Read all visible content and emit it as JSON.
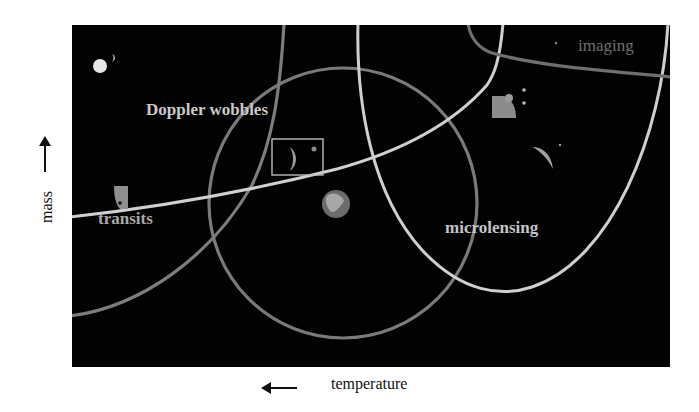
{
  "diagram": {
    "type": "exoplanet-detection-methods",
    "regions": [
      {
        "id": "doppler",
        "label": "Doppler wobbles"
      },
      {
        "id": "transits",
        "label": "transits"
      },
      {
        "id": "microlensing",
        "label": "microlensing"
      },
      {
        "id": "imaging",
        "label": "imaging"
      }
    ],
    "axes": {
      "y_label": "mass",
      "y_direction": "up",
      "x_label": "temperature",
      "x_direction": "left"
    },
    "colors": {
      "background": "#020202",
      "light_curve": "#cfcfcf",
      "gray_curve": "#7d7d7d",
      "label_light": "#c9c9c9",
      "label_imaging": "#6e6e6e",
      "axis_text": "#111111"
    }
  }
}
